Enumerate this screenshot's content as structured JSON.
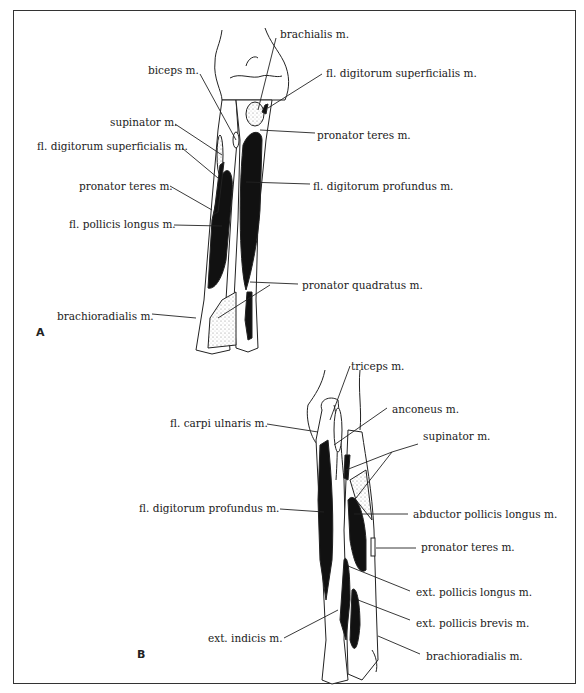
{
  "figure": {
    "panels": [
      {
        "id": "A",
        "label": "A",
        "labels": [
          {
            "text": "brachialis m.",
            "x": 280,
            "y": 30
          },
          {
            "text": "biceps m.",
            "x": 148,
            "y": 64
          },
          {
            "text": "fl. digitorum superficialis m.",
            "x": 326,
            "y": 68
          },
          {
            "text": "supinator m.",
            "x": 110,
            "y": 116
          },
          {
            "text": "pronator teres m.",
            "x": 317,
            "y": 129
          },
          {
            "text": "fl. digitorum superficialis m.",
            "x": 37,
            "y": 140
          },
          {
            "text": "pronator teres m.",
            "x": 79,
            "y": 179
          },
          {
            "text": "fl. digitorum profundus m.",
            "x": 313,
            "y": 180
          },
          {
            "text": "fl. pollicis longus m.",
            "x": 69,
            "y": 217
          },
          {
            "text": "pronator quadratus m.",
            "x": 302,
            "y": 280
          },
          {
            "text": "brachioradialis m.",
            "x": 57,
            "y": 310
          }
        ]
      },
      {
        "id": "B",
        "label": "B",
        "labels": [
          {
            "text": "triceps m.",
            "x": 351,
            "y": 361
          },
          {
            "text": "anconeus m.",
            "x": 392,
            "y": 403
          },
          {
            "text": "fl. carpi ulnaris m.",
            "x": 170,
            "y": 416
          },
          {
            "text": "supinator m.",
            "x": 423,
            "y": 428
          },
          {
            "text": "fl. digitorum profundus m.",
            "x": 139,
            "y": 502
          },
          {
            "text": "abductor pollicis longus m.",
            "x": 413,
            "y": 508
          },
          {
            "text": "pronator teres m.",
            "x": 421,
            "y": 540
          },
          {
            "text": "ext. pollicis longus m.",
            "x": 416,
            "y": 586
          },
          {
            "text": "ext. pollicis brevis m.",
            "x": 416,
            "y": 616
          },
          {
            "text": "ext. indicis m.",
            "x": 208,
            "y": 632
          },
          {
            "text": "brachioradialis m.",
            "x": 426,
            "y": 649
          }
        ]
      }
    ]
  }
}
